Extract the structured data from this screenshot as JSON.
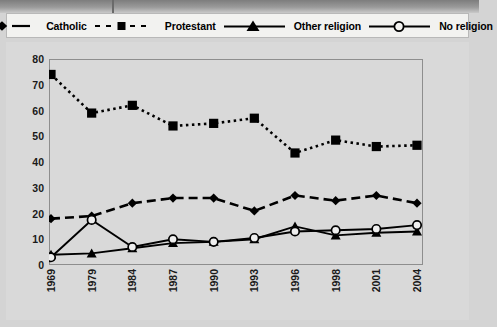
{
  "legend": {
    "entries": [
      {
        "label": "Catholic",
        "marker": "diamond",
        "line": "dashed",
        "color": "#000000"
      },
      {
        "label": "Protestant",
        "marker": "square",
        "line": "dotted",
        "color": "#000000"
      },
      {
        "label": "Other religion",
        "marker": "triangle",
        "line": "solid",
        "color": "#000000"
      },
      {
        "label": "No religion",
        "marker": "circle-open",
        "line": "solid",
        "color": "#000000"
      }
    ]
  },
  "chart_data": {
    "type": "line",
    "title": "",
    "xlabel": "",
    "ylabel": "",
    "ylim": [
      0,
      80
    ],
    "yticks": [
      0,
      10,
      20,
      30,
      40,
      50,
      60,
      70,
      80
    ],
    "grid": false,
    "legend_position": "top",
    "categories": [
      "1969",
      "1979",
      "1984",
      "1987",
      "1990",
      "1993",
      "1996",
      "1998",
      "2001",
      "2004"
    ],
    "series": [
      {
        "name": "Catholic",
        "marker": "diamond",
        "line": "dashed",
        "values": [
          18,
          19,
          24,
          26,
          26,
          21,
          27,
          25,
          27,
          24
        ]
      },
      {
        "name": "Protestant",
        "marker": "square",
        "line": "dotted",
        "values": [
          74,
          59,
          62,
          54,
          55,
          57,
          43.5,
          48.5,
          46,
          46.5
        ]
      },
      {
        "name": "Other religion",
        "marker": "triangle",
        "line": "solid",
        "values": [
          4,
          4.5,
          6.5,
          8.5,
          9,
          10,
          15,
          11.5,
          12.5,
          13
        ]
      },
      {
        "name": "No religion",
        "marker": "circle-open",
        "line": "solid",
        "values": [
          3,
          17.5,
          7,
          10,
          9,
          10.5,
          13,
          13.5,
          14,
          15.5
        ]
      }
    ]
  }
}
